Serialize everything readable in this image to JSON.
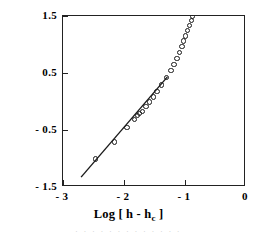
{
  "chart_data": {
    "type": "scatter",
    "title": "",
    "xlabel": "Log [ h - h_c ]",
    "ylabel": "Log[(σ - q_c ) / q_c ]",
    "xlim": [
      -3,
      0
    ],
    "ylim": [
      -1.5,
      1.5
    ],
    "xticks": [
      -3,
      -2,
      -1,
      0
    ],
    "xticklabels": [
      "- 3",
      "- 2",
      "- 1",
      "0"
    ],
    "yticks": [
      1.5,
      0.5,
      -0.5,
      -1.5
    ],
    "yticklabels": [
      "1.5",
      "0.5",
      "- 0.5",
      "- 1.5"
    ],
    "grid": false,
    "legend": null,
    "marker": "open-circle",
    "series": [
      {
        "name": "data",
        "marker": "open-circle",
        "x": [
          -2.47,
          -2.15,
          -1.95,
          -1.83,
          -1.78,
          -1.74,
          -1.7,
          -1.64,
          -1.58,
          -1.52,
          -1.46,
          -1.38,
          -1.3,
          -1.23,
          -1.18,
          -1.13,
          -1.09,
          -1.05,
          -1.02,
          -0.99,
          -0.96,
          -0.93,
          -0.9,
          -0.88
        ],
        "y": [
          -1.01,
          -0.71,
          -0.46,
          -0.31,
          -0.25,
          -0.21,
          -0.17,
          -0.09,
          -0.01,
          0.08,
          0.17,
          0.29,
          0.42,
          0.55,
          0.65,
          0.76,
          0.86,
          0.97,
          1.06,
          1.15,
          1.24,
          1.33,
          1.42,
          1.49
        ]
      }
    ],
    "fit_line": {
      "name": "linear fit",
      "x": [
        -2.7,
        -1.27
      ],
      "y": [
        -1.36,
        0.42
      ],
      "slope": 1.24
    }
  },
  "bleed_text": "· · · · · · · · · · · · ·"
}
